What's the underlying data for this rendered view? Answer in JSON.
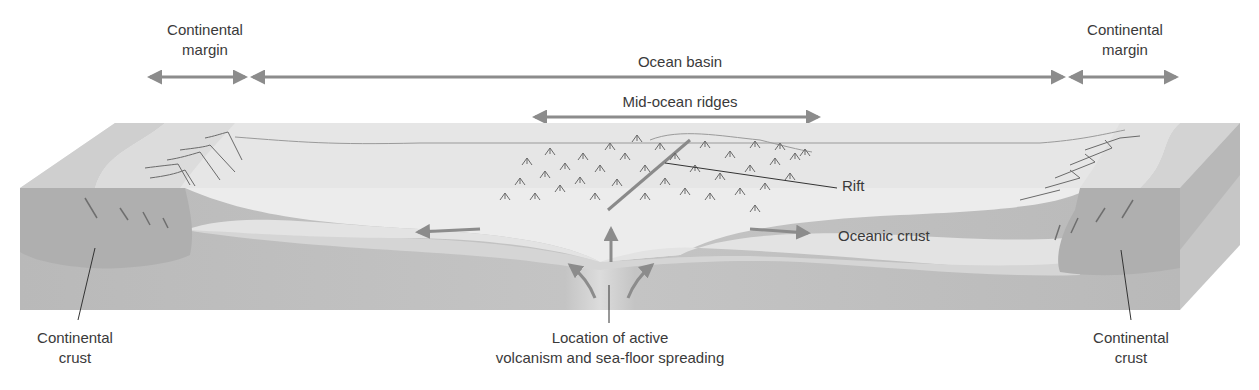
{
  "diagram": {
    "type": "cross-section",
    "colors": {
      "background": "#ffffff",
      "sea_surface": "#ececec",
      "continental_shelf_top": "#dcdcdc",
      "ocean_floor_light": "#e9e9e9",
      "oceanic_crust": "#e2e2e2",
      "mantle": "#bdbdbd",
      "continental_crust": "#afafaf",
      "block_side": "#c8c8c8",
      "arrow": "#8c8c8c",
      "text": "#3a3a3a",
      "ridge_marks": "#6a6a6a"
    },
    "top_labels": {
      "continental_margin_left": {
        "line1": "Continental",
        "line2": "margin"
      },
      "ocean_basin": "Ocean basin",
      "continental_margin_right": {
        "line1": "Continental",
        "line2": "margin"
      },
      "mid_ocean_ridges": "Mid-ocean ridges"
    },
    "inline_labels": {
      "rift": "Rift",
      "oceanic_crust": "Oceanic crust"
    },
    "bottom_labels": {
      "continental_crust_left": {
        "line1": "Continental",
        "line2": "crust"
      },
      "volcanism": {
        "line1": "Location of active",
        "line2": "volcanism and sea-floor spreading"
      },
      "continental_crust_right": {
        "line1": "Continental",
        "line2": "crust"
      }
    },
    "extent_arrows": [
      {
        "name": "continental-margin-left",
        "x1": 147,
        "x2": 247,
        "y": 77
      },
      {
        "name": "ocean-basin",
        "x1": 250,
        "x2": 1065,
        "y": 77
      },
      {
        "name": "continental-margin-right",
        "x1": 1068,
        "x2": 1178,
        "y": 77
      },
      {
        "name": "mid-ocean-ridges",
        "x1": 532,
        "x2": 820,
        "y": 117
      }
    ]
  }
}
